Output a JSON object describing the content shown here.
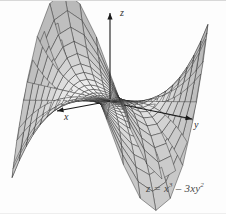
{
  "figure": {
    "kind": "3d-surface-plot",
    "background_color": "#fdfdfd",
    "mesh_line_color": "#2b2b2b",
    "surface_fill_light": "#f2f2f2",
    "surface_fill_dark": "#6e6e6e",
    "axis_color": "#1a1a1a"
  },
  "equation": {
    "lhs": "z",
    "eq": " = ",
    "term1_base": "x",
    "term1_exp": "3",
    "minus": " – 3",
    "term2_base": "xy",
    "term2_exp": "2",
    "plain": "z = x³ – 3xy²"
  },
  "axes": [
    {
      "name": "z-axis",
      "label": "z",
      "direction": "up"
    },
    {
      "name": "x-axis",
      "label": "x",
      "direction": "down-left"
    },
    {
      "name": "y-axis",
      "label": "y",
      "direction": "right"
    }
  ],
  "chart_data": {
    "type": "surface",
    "title": "",
    "function": "z = x^3 - 3*x*y^2",
    "surface_name": "monkey saddle",
    "xlabel": "x",
    "ylabel": "y",
    "zlabel": "z",
    "domain": {
      "r_min": 0,
      "r_max": 1.0,
      "theta_min": 0,
      "theta_max": 6.283185
    },
    "mesh": {
      "radial_divisions": 14,
      "angular_divisions": 36,
      "style": "wireframe-shaded"
    },
    "features": {
      "saddle_point": [
        0,
        0,
        0
      ],
      "rising_lobes": 3,
      "falling_lobes": 3,
      "note": "three ridges up and three valleys down around the origin"
    },
    "projection": {
      "type": "axonometric",
      "origin_px": [
        110,
        100
      ],
      "z_scale_px": 88,
      "x_axis_px": [
        -52,
        10
      ],
      "y_axis_px": [
        83,
        19
      ],
      "elevation_deg": 22,
      "azimuth_deg": 35
    },
    "grid": true,
    "legend": "none",
    "annotations": [
      {
        "text": "z = x³ – 3xy²",
        "position_px": [
          146,
          188
        ]
      }
    ]
  }
}
